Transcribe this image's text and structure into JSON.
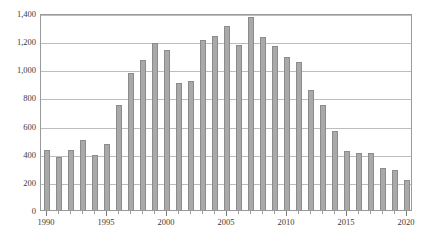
{
  "chart_data": {
    "type": "bar",
    "title": "",
    "subtitle": "",
    "xlabel": "",
    "ylabel": "",
    "legend": [],
    "grid": true,
    "legend_position": "none",
    "xlim": [
      1989.5,
      2020.5
    ],
    "ylim": [
      0,
      1400
    ],
    "y_ticks": [
      0,
      200,
      400,
      600,
      800,
      1000,
      1200,
      1400
    ],
    "y_tick_labels": [
      "0",
      "200",
      "400",
      "600",
      "800",
      "1,000",
      "1,200",
      "1,400"
    ],
    "x_ticks": [
      1990,
      1995,
      2000,
      2005,
      2010,
      2015,
      2020
    ],
    "x_tick_labels": [
      "1990",
      "1995",
      "2000",
      "2005",
      "2010",
      "2015",
      "2020"
    ],
    "bar_color": "#a9a9a9",
    "bar_edge_color": "#8c8c8c",
    "grid_color": "#bdbdbd",
    "frame_color": "#9a9a9a",
    "categories": [
      "1990",
      "1991",
      "1992",
      "1993",
      "1994",
      "1995",
      "1996",
      "1997",
      "1998",
      "1999",
      "2000",
      "2001",
      "2002",
      "2003",
      "2004",
      "2005",
      "2006",
      "2007",
      "2008",
      "2009",
      "2010",
      "2011",
      "2012",
      "2013",
      "2014",
      "2015",
      "2016",
      "2017",
      "2018",
      "2019",
      "2020"
    ],
    "values": [
      425,
      375,
      430,
      495,
      390,
      470,
      745,
      975,
      1065,
      1190,
      1140,
      900,
      915,
      1210,
      1240,
      1310,
      1175,
      1375,
      1230,
      1165,
      1090,
      1055,
      850,
      745,
      560,
      420,
      405,
      405,
      300,
      285,
      215
    ]
  }
}
